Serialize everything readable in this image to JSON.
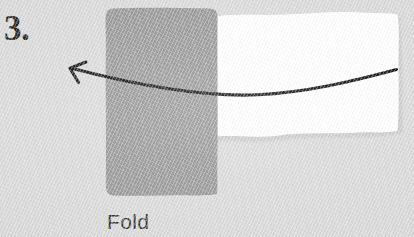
{
  "figure": {
    "kind": "instructional-fold-diagram",
    "step_number": "3.",
    "caption": "Fold",
    "background_color": "#d9d9d9",
    "background_texture": "diagonal-paper-weave"
  },
  "shapes": {
    "folded_flap": {
      "label": "folded-gray-paper-flap",
      "fill": "#949494",
      "edge_style": "hand-drawn-rounded",
      "bounds": {
        "x": 105,
        "y": 8,
        "width": 113,
        "height": 188
      }
    },
    "paper_sheet": {
      "label": "white-paper-sheet",
      "fill": "#ffffff",
      "edge_style": "wavy-organic",
      "bounds": {
        "x": 214,
        "y": 13,
        "width": 184,
        "height": 125
      }
    }
  },
  "annotations": {
    "fold_arrow": {
      "label": "curved-fold-arrow",
      "color": "#0d0d0d",
      "direction": "right-to-left",
      "head": "open-chevron",
      "tip": {
        "x": 70,
        "y": 68
      },
      "tail": {
        "x": 396,
        "y": 70
      },
      "lowest_point": {
        "x": 258,
        "y": 95
      },
      "stroke_width_px": 3
    }
  },
  "icons": {
    "arrow_left_icon": "arrow-left-curved"
  }
}
